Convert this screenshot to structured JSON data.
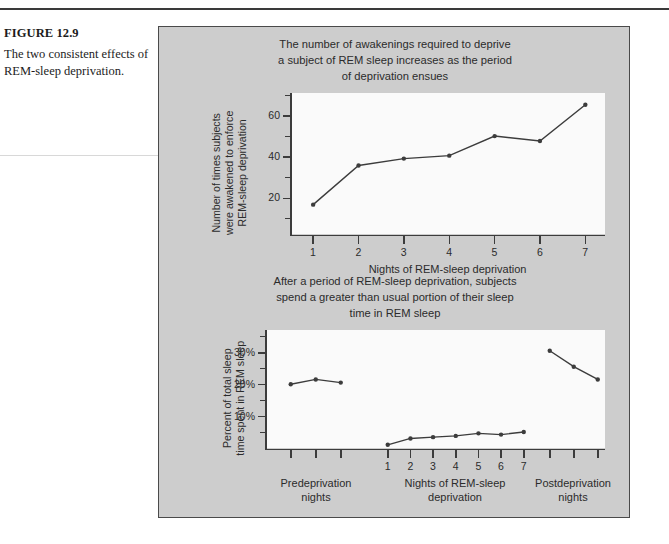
{
  "caption": {
    "figure_number": "FIGURE 12.9",
    "text": "The two consistent effects of REM-sleep deprivation."
  },
  "colors": {
    "figure_background": "#cdcdcd",
    "plot_background": "#fafafa",
    "ink": "#3c3c3c",
    "border": "#4a4a4a"
  },
  "panels": [
    {
      "id": "awakenings",
      "title": "The number of awakenings required to deprive a subject of REM sleep increases as the period of deprivation ensues",
      "title_lines": [
        "The number of awakenings required to deprive",
        "a subject of REM sleep increases as the period",
        "of deprivation ensues"
      ],
      "ylabel_lines": [
        "Number of times subjects",
        "were awakened to enforce",
        "REM-sleep deprivation"
      ],
      "xlabel": "Nights of REM-sleep deprivation"
    },
    {
      "id": "rem-percent",
      "title": "After a period of REM-sleep deprivation, subjects spend a greater than usual portion of their sleep time in REM sleep",
      "title_lines": [
        "After a period of REM-sleep deprivation, subjects",
        "spend a greater than usual portion of their sleep",
        "time in REM sleep"
      ],
      "ylabel_lines": [
        "Percent of total sleep",
        "time spent in REM sleep"
      ],
      "group_labels": [
        {
          "lines": [
            "Predeprivation",
            "nights"
          ]
        },
        {
          "lines": [
            "Nights of REM-sleep",
            "deprivation"
          ]
        },
        {
          "lines": [
            "Postdeprivation",
            "nights"
          ]
        }
      ]
    }
  ],
  "chart_data": [
    {
      "type": "line",
      "id": "awakenings",
      "title": "The number of awakenings required to deprive a subject of REM sleep increases as the period of deprivation ensues",
      "xlabel": "Nights of REM-sleep deprivation",
      "ylabel": "Number of times subjects were awakened to enforce REM-sleep deprivation",
      "x": [
        1,
        2,
        3,
        4,
        5,
        6,
        7
      ],
      "xticklabels": [
        "1",
        "2",
        "3",
        "4",
        "5",
        "6",
        "7"
      ],
      "values": [
        15,
        35,
        38.5,
        40,
        50,
        47.5,
        66
      ],
      "yticks": [
        20,
        40,
        60
      ],
      "yticklabels": [
        "20",
        "40",
        "60"
      ],
      "yminorticks": [
        10,
        30,
        50,
        70
      ],
      "xlim": [
        0.55,
        7.45
      ],
      "ylim": [
        0,
        72
      ],
      "grid": false,
      "legend": "none",
      "markers": true
    },
    {
      "type": "line",
      "id": "rem-percent",
      "title": "After a period of REM-sleep deprivation, subjects spend a greater than usual portion of their sleep time in REM sleep",
      "xlabel": "",
      "ylabel": "Percent of total sleep time spent in REM sleep",
      "yticks": [
        10,
        20,
        30
      ],
      "yticklabels": [
        "10%",
        "20%",
        "30%"
      ],
      "yminorticks": [
        5,
        15,
        25,
        35
      ],
      "ylim": [
        0,
        37
      ],
      "grid": false,
      "legend": "none",
      "markers": true,
      "series": [
        {
          "name": "Predeprivation nights",
          "xticklabels": [
            "",
            "",
            ""
          ],
          "values": [
            20.0,
            21.5,
            20.5
          ]
        },
        {
          "name": "Nights of REM-sleep deprivation",
          "xticklabels": [
            "1",
            "2",
            "3",
            "4",
            "5",
            "6",
            "7"
          ],
          "values": [
            1.0,
            3.0,
            3.4,
            3.8,
            4.6,
            4.2,
            5.0
          ]
        },
        {
          "name": "Postdeprivation nights",
          "xticklabels": [
            "",
            "",
            ""
          ],
          "values": [
            30.5,
            25.5,
            21.5
          ]
        }
      ]
    }
  ]
}
